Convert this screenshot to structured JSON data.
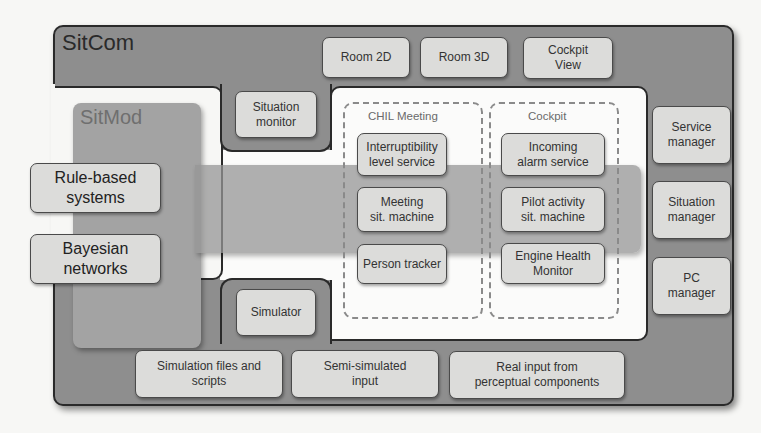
{
  "diagram": {
    "sitcom": {
      "title": "SitCom",
      "top_views": [
        {
          "label": "Room 2D"
        },
        {
          "label": "Room 3D"
        },
        {
          "label": "Cockpit\nView"
        }
      ],
      "situation_monitor": "Situation\nmonitor",
      "simulator": "Simulator",
      "managers": [
        {
          "label": "Service\nmanager"
        },
        {
          "label": "Situation\nmanager"
        },
        {
          "label": "PC\nmanager"
        }
      ],
      "inputs": [
        {
          "label": "Simulation files and\nscripts"
        },
        {
          "label": "Semi-simulated\ninput"
        },
        {
          "label": "Real input from\nperceptual components"
        }
      ]
    },
    "sitmod": {
      "title": "SitMod",
      "engines": [
        {
          "label": "Rule-based\nsystems"
        },
        {
          "label": "Bayesian\nnetworks"
        }
      ]
    },
    "groups": {
      "chil": {
        "title": "CHIL Meeting",
        "items": [
          {
            "label": "Interruptibility\nlevel service"
          },
          {
            "label": "Meeting\nsit. machine"
          },
          {
            "label": "Person tracker"
          }
        ]
      },
      "cockpit": {
        "title": "Cockpit",
        "items": [
          {
            "label": "Incoming\nalarm service"
          },
          {
            "label": "Pilot activity\nsit. machine"
          },
          {
            "label": "Engine Health\nMonitor"
          }
        ]
      }
    },
    "colors": {
      "sitcom_fill": "#8e8e8e",
      "sitmod_fill": "#a3a3a3",
      "box_fill": "#dcdcda",
      "outline": "#2a2a2a",
      "background": "#f7f7f5"
    }
  }
}
